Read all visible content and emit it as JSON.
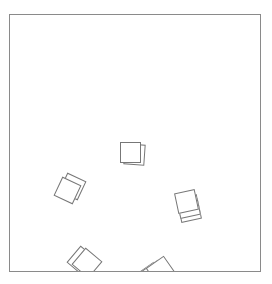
{
  "scene": {
    "frame": {
      "x": 9,
      "y": 14,
      "width": 252,
      "height": 258,
      "border_color": "#8a8a8a"
    },
    "stacks": [
      {
        "name": "stack-center",
        "cards": [
          {
            "x": 124,
            "y": 144,
            "size": 21,
            "rotate": 4
          },
          {
            "x": 120,
            "y": 142,
            "size": 21,
            "rotate": 0
          }
        ]
      },
      {
        "name": "stack-left",
        "cards": [
          {
            "x": 62,
            "y": 176,
            "size": 21,
            "rotate": 25
          },
          {
            "x": 57,
            "y": 180,
            "size": 21,
            "rotate": 25
          }
        ]
      },
      {
        "name": "stack-right",
        "cards": [
          {
            "x": 179,
            "y": 200,
            "size": 21,
            "rotate": -12
          },
          {
            "x": 178,
            "y": 196,
            "size": 21,
            "rotate": -12
          },
          {
            "x": 176,
            "y": 191,
            "size": 21,
            "rotate": -12
          }
        ]
      },
      {
        "name": "stack-bottom-left",
        "cards": [
          {
            "x": 71,
            "y": 250,
            "size": 22,
            "rotate": 40
          },
          {
            "x": 76,
            "y": 252,
            "size": 22,
            "rotate": 40
          }
        ]
      },
      {
        "name": "stack-bottom-center",
        "cards": [
          {
            "x": 140,
            "y": 266,
            "size": 22,
            "rotate": -35
          },
          {
            "x": 144,
            "y": 264,
            "size": 22,
            "rotate": -35
          },
          {
            "x": 150,
            "y": 260,
            "size": 22,
            "rotate": -35
          }
        ]
      }
    ],
    "card_border_color": "#777777"
  }
}
